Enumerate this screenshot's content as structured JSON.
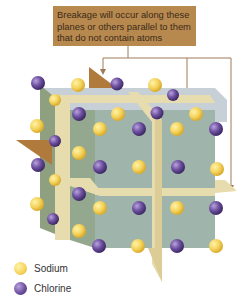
{
  "callout": {
    "lines": [
      "Breakage will occur along these",
      "planes or others parallel to them",
      "that do not contain atoms"
    ]
  },
  "legend": {
    "items": [
      {
        "label": "Sodium",
        "color": "#f2cf55"
      },
      {
        "label": "Chlorine",
        "color": "#6a4b9a"
      }
    ]
  },
  "colors": {
    "callout_bg": "#b8894f",
    "arrow": "#a07a58",
    "plane_tan": "#e6dcae",
    "plane_brown": "#b07a3c",
    "cube_front": "#9fb5ab",
    "cube_side": "#8ea07f",
    "cube_top": "#c6d0d6"
  }
}
